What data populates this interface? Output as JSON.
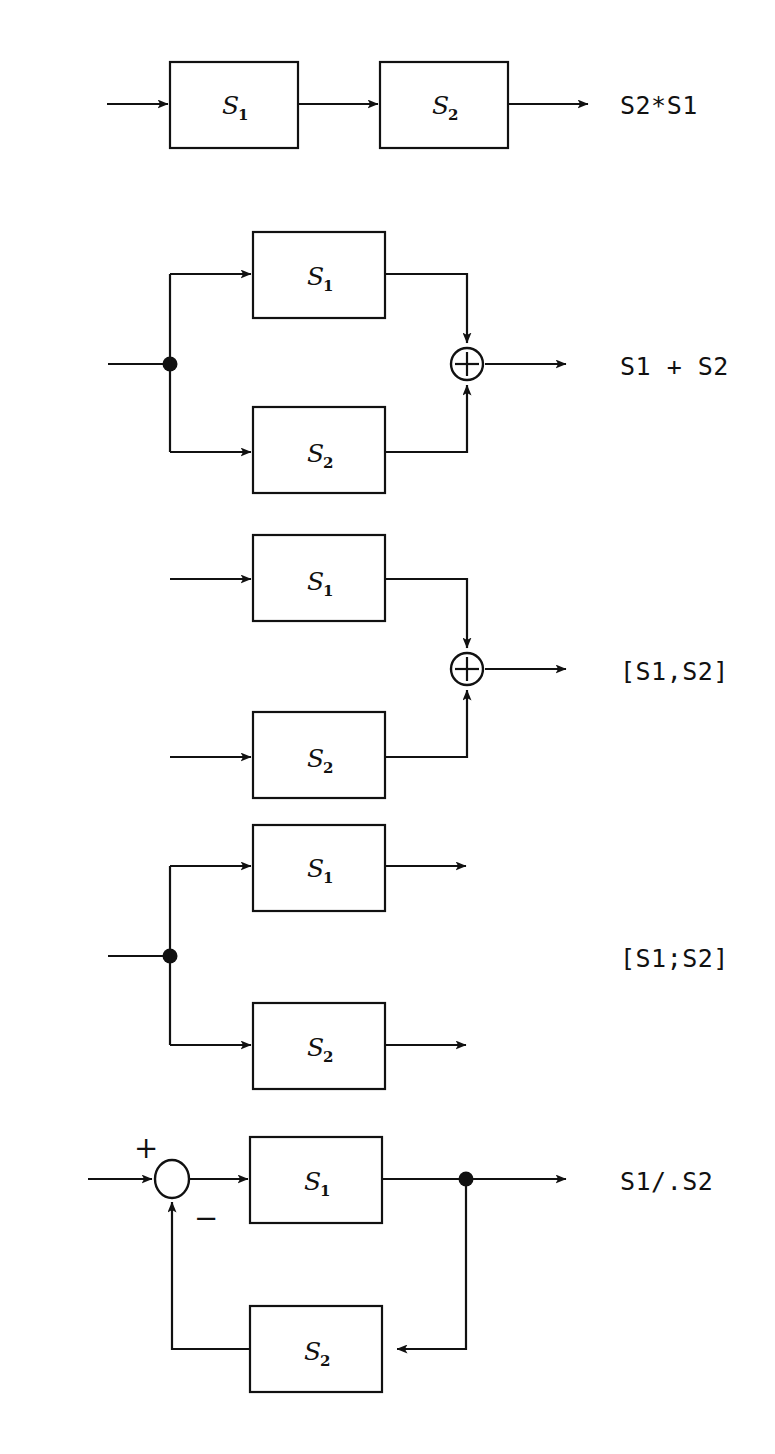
{
  "figure": {
    "background_color": "#ffffff",
    "line_color": "#111111",
    "width": 775,
    "height": 1454
  },
  "diagrams": [
    {
      "id": "series",
      "result_label": "S2*S1",
      "blocks": [
        {
          "name": "S",
          "subscript": "1"
        },
        {
          "name": "S",
          "subscript": "2"
        }
      ],
      "junctions": [],
      "signs": []
    },
    {
      "id": "parallel-sum",
      "result_label": "S1 + S2",
      "blocks": [
        {
          "name": "S",
          "subscript": "1"
        },
        {
          "name": "S",
          "subscript": "2"
        }
      ],
      "junctions": [
        "split-dot",
        "summing-junction"
      ],
      "signs": []
    },
    {
      "id": "horizontal-concat",
      "result_label": "[S1,S2]",
      "blocks": [
        {
          "name": "S",
          "subscript": "1"
        },
        {
          "name": "S",
          "subscript": "2"
        }
      ],
      "junctions": [
        "summing-junction"
      ],
      "signs": []
    },
    {
      "id": "vertical-concat",
      "result_label": "[S1;S2]",
      "blocks": [
        {
          "name": "S",
          "subscript": "1"
        },
        {
          "name": "S",
          "subscript": "2"
        }
      ],
      "junctions": [
        "split-dot"
      ],
      "signs": []
    },
    {
      "id": "feedback",
      "result_label": "S1/.S2",
      "blocks": [
        {
          "name": "S",
          "subscript": "1"
        },
        {
          "name": "S",
          "subscript": "2"
        }
      ],
      "junctions": [
        "summing-circle",
        "split-dot"
      ],
      "signs": [
        "+",
        "−"
      ]
    }
  ]
}
